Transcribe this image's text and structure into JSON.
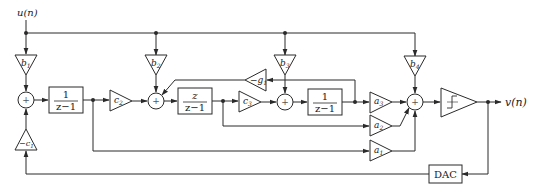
{
  "diagram": {
    "input": {
      "label": "u(n)"
    },
    "output": {
      "label": "v(n)"
    },
    "feedforward_gains": [
      {
        "id": "b1",
        "label": "b",
        "sub": "1"
      },
      {
        "id": "b2",
        "label": "b",
        "sub": "2"
      },
      {
        "id": "b3",
        "label": "b",
        "sub": "3"
      },
      {
        "id": "b4",
        "label": "b",
        "sub": "4"
      }
    ],
    "integrators": [
      {
        "id": "int1",
        "num": "1",
        "den": "z−1"
      },
      {
        "id": "int2",
        "num": "z",
        "den": "z−1"
      },
      {
        "id": "int3",
        "num": "1",
        "den": "z−1"
      }
    ],
    "coupling_gains": [
      {
        "id": "c2",
        "label": "c",
        "sub": "2"
      },
      {
        "id": "c3",
        "label": "c",
        "sub": "3"
      }
    ],
    "feedback_gains": [
      {
        "id": "neg_c1",
        "label": "−c",
        "sub": "1"
      },
      {
        "id": "neg_g1",
        "label": "−g",
        "sub": "1"
      }
    ],
    "output_gains": [
      {
        "id": "a3",
        "label": "a",
        "sub": "3"
      },
      {
        "id": "a2",
        "label": "a",
        "sub": "2"
      },
      {
        "id": "a1",
        "label": "a",
        "sub": "1"
      }
    ],
    "summers": [
      {
        "id": "sum1",
        "symbol": "+"
      },
      {
        "id": "sum2",
        "symbol": "+"
      },
      {
        "id": "sum3",
        "symbol": "+"
      },
      {
        "id": "sum4",
        "symbol": "+"
      }
    ],
    "quantizer": {
      "label": "quantizer",
      "symbol": "step"
    },
    "dac": {
      "label": "DAC"
    }
  }
}
